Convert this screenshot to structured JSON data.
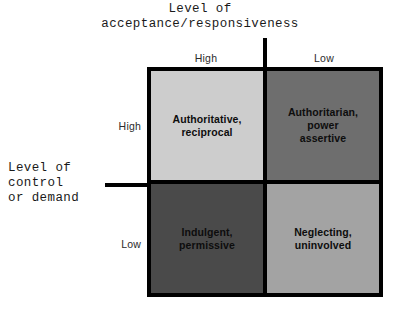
{
  "figure": {
    "type": "2x2-matrix-diagram",
    "axes": {
      "horizontal": {
        "title": "Level of\nacceptance/responsiveness",
        "title_line1": "Level of",
        "title_line2": "acceptance/responsiveness",
        "ticks": [
          "High",
          "Low"
        ]
      },
      "vertical": {
        "title": "Level of\ncontrol\nor demand",
        "title_line1": "Level of",
        "title_line2": "control",
        "title_line3": "or demand",
        "ticks": [
          "High",
          "Low"
        ]
      }
    },
    "quadrants": [
      {
        "id": "high-control-high-acceptance",
        "label": "Authoritative,\nreciprocal",
        "control": "High",
        "acceptance": "High",
        "fill": "#cdcdcd"
      },
      {
        "id": "high-control-low-acceptance",
        "label": "Authoritarian,\npower\nassertive",
        "control": "High",
        "acceptance": "Low",
        "fill": "#6e6e6e"
      },
      {
        "id": "low-control-high-acceptance",
        "label": "Indulgent,\npermissive",
        "control": "Low",
        "acceptance": "High",
        "fill": "#4a4a4a"
      },
      {
        "id": "low-control-low-acceptance",
        "label": "Neglecting,\nuninvolved",
        "control": "Low",
        "acceptance": "Low",
        "fill": "#a3a3a3"
      }
    ],
    "colors": {
      "background": "#ffffff",
      "line": "#000000",
      "text": "#0d0d0d"
    }
  }
}
